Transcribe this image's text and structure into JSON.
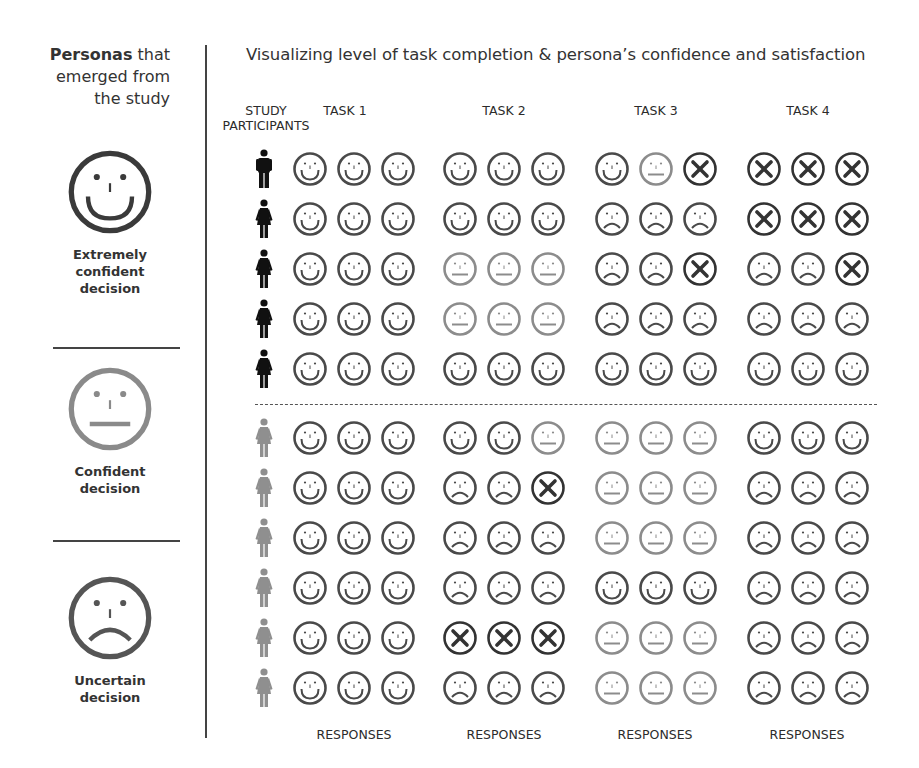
{
  "left_panel": {
    "title_bold": "Personas",
    "title_rest": " that emerged from the study",
    "legend": [
      {
        "type": "happy",
        "label_line1": "Extremely",
        "label_line2": "confident",
        "label_line3": "decision",
        "color": "#3a3a3a"
      },
      {
        "type": "neutral",
        "label_line1": "Confident",
        "label_line2": "decision",
        "label_line3": "",
        "color": "#8a8a8a"
      },
      {
        "type": "sad",
        "label_line1": "Uncertain",
        "label_line2": "decision",
        "label_line3": "",
        "color": "#555555"
      }
    ]
  },
  "main": {
    "title": "Visualizing level of task completion & persona’s confidence and satisfaction",
    "participants_header_line1": "STUDY",
    "participants_header_line2": "PARTICIPANTS",
    "tasks": [
      {
        "label": "TASK 1",
        "footer": "RESPONSES"
      },
      {
        "label": "TASK 2",
        "footer": "RESPONSES"
      },
      {
        "label": "TASK 3",
        "footer": "RESPONSES"
      },
      {
        "label": "TASK 4",
        "footer": "RESPONSES"
      }
    ],
    "legend_key": {
      "H": "extremely confident (happy)",
      "N": "confident (neutral)",
      "S": "uncertain (sad)",
      "X": "task failed (cross)"
    },
    "colors": {
      "dark_persona": "#111111",
      "light_persona": "#8f8f8f",
      "happy": "#4a4a4a",
      "neutral": "#8c8c8c",
      "sad": "#4a4a4a",
      "fail": "#333333"
    },
    "participants": [
      {
        "persona": "dark",
        "gender": "male",
        "responses": [
          [
            "H",
            "H",
            "H"
          ],
          [
            "H",
            "H",
            "H"
          ],
          [
            "H",
            "N",
            "X"
          ],
          [
            "X",
            "X",
            "X"
          ]
        ]
      },
      {
        "persona": "dark",
        "gender": "female",
        "responses": [
          [
            "H",
            "H",
            "H"
          ],
          [
            "H",
            "H",
            "H"
          ],
          [
            "S",
            "S",
            "S"
          ],
          [
            "X",
            "X",
            "X"
          ]
        ]
      },
      {
        "persona": "dark",
        "gender": "female",
        "responses": [
          [
            "H",
            "H",
            "H"
          ],
          [
            "N",
            "N",
            "N"
          ],
          [
            "S",
            "S",
            "X"
          ],
          [
            "S",
            "S",
            "X"
          ]
        ]
      },
      {
        "persona": "dark",
        "gender": "female",
        "responses": [
          [
            "H",
            "H",
            "H"
          ],
          [
            "N",
            "N",
            "N"
          ],
          [
            "S",
            "S",
            "S"
          ],
          [
            "S",
            "S",
            "S"
          ]
        ]
      },
      {
        "persona": "dark",
        "gender": "female",
        "responses": [
          [
            "H",
            "H",
            "H"
          ],
          [
            "H",
            "H",
            "H"
          ],
          [
            "H",
            "H",
            "H"
          ],
          [
            "H",
            "H",
            "H"
          ]
        ]
      },
      {
        "persona": "light",
        "gender": "female",
        "responses": [
          [
            "H",
            "H",
            "H"
          ],
          [
            "H",
            "H",
            "N"
          ],
          [
            "N",
            "N",
            "N"
          ],
          [
            "H",
            "H",
            "H"
          ]
        ]
      },
      {
        "persona": "light",
        "gender": "female",
        "responses": [
          [
            "H",
            "H",
            "H"
          ],
          [
            "S",
            "S",
            "X"
          ],
          [
            "N",
            "N",
            "N"
          ],
          [
            "S",
            "S",
            "S"
          ]
        ]
      },
      {
        "persona": "light",
        "gender": "female",
        "responses": [
          [
            "H",
            "H",
            "H"
          ],
          [
            "S",
            "S",
            "S"
          ],
          [
            "N",
            "N",
            "N"
          ],
          [
            "S",
            "S",
            "S"
          ]
        ]
      },
      {
        "persona": "light",
        "gender": "female",
        "responses": [
          [
            "H",
            "H",
            "H"
          ],
          [
            "S",
            "S",
            "S"
          ],
          [
            "H",
            "H",
            "H"
          ],
          [
            "S",
            "S",
            "S"
          ]
        ]
      },
      {
        "persona": "light",
        "gender": "female",
        "responses": [
          [
            "H",
            "H",
            "H"
          ],
          [
            "X",
            "X",
            "X"
          ],
          [
            "N",
            "N",
            "N"
          ],
          [
            "S",
            "S",
            "S"
          ]
        ]
      },
      {
        "persona": "light",
        "gender": "female",
        "responses": [
          [
            "H",
            "H",
            "H"
          ],
          [
            "S",
            "S",
            "S"
          ],
          [
            "N",
            "N",
            "N"
          ],
          [
            "S",
            "S",
            "S"
          ]
        ]
      }
    ]
  }
}
